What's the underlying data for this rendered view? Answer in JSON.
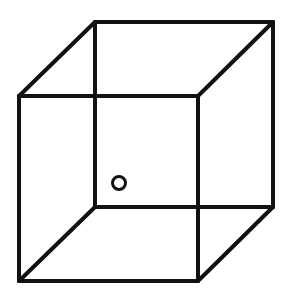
{
  "figure": {
    "type": "necker-cube",
    "stroke_color": "#111111",
    "background": "#ffffff",
    "stroke_width": 4,
    "front_face": [
      [
        19,
        96
      ],
      [
        198,
        96
      ],
      [
        198,
        281
      ],
      [
        19,
        281
      ]
    ],
    "back_face": [
      [
        95,
        22
      ],
      [
        273,
        22
      ],
      [
        273,
        207
      ],
      [
        95,
        207
      ]
    ],
    "marker": {
      "cx": 119,
      "cy": 183,
      "r": 6.5
    }
  }
}
